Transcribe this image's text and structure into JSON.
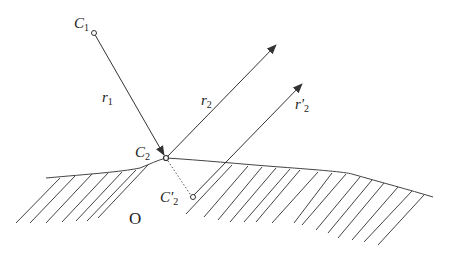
{
  "diagram": {
    "labels": {
      "c1": {
        "main": "C",
        "sub": "1"
      },
      "c2": {
        "main": "C",
        "sub": "2"
      },
      "c2p": {
        "main": "C'",
        "sub": "2"
      },
      "r1": {
        "main": "r",
        "sub": "1"
      },
      "r2": {
        "main": "r",
        "sub": "2"
      },
      "r2p": {
        "main": "r'",
        "sub": "2"
      },
      "region": "O"
    },
    "colors": {
      "stroke": "#333333"
    }
  }
}
